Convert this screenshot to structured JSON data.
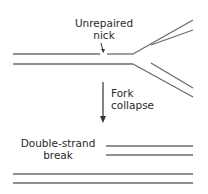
{
  "diagram": {
    "labels": {
      "nick_line1": "Unrepaired",
      "nick_line2": "nick",
      "step_line1": "Fork",
      "step_line2": "collapse",
      "result_line1": "Double-strand",
      "result_line2": "break"
    },
    "colors": {
      "strand": "#6b6b6b",
      "arrow": "#333333",
      "text": "#2a2a2a"
    }
  }
}
